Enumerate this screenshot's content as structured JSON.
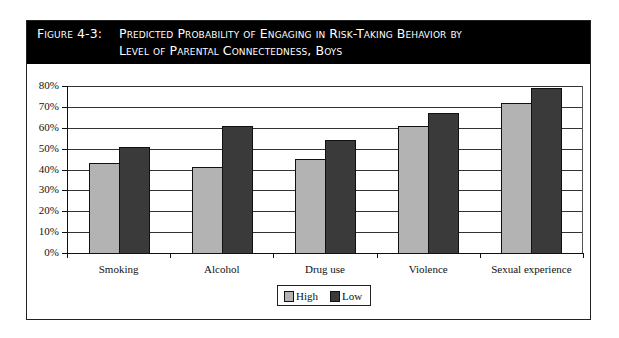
{
  "figure": {
    "label": "Figure 4-3:",
    "title_line1": "Predicted Probability of Engaging in Risk-Taking Behavior by",
    "title_line2": "Level of Parental Connectedness, Boys"
  },
  "colors": {
    "high": "#b3b3b3",
    "low": "#3a3a3a",
    "titlebar": "#000000"
  },
  "chart_data": {
    "type": "bar",
    "title": "Figure 4-3: Predicted Probability of Engaging in Risk-Taking Behavior by Level of Parental Connectedness, Boys",
    "categories": [
      "Smoking",
      "Alcohol",
      "Drug use",
      "Violence",
      "Sexual experience"
    ],
    "series": [
      {
        "name": "High",
        "values": [
          43,
          41,
          45,
          61,
          72
        ]
      },
      {
        "name": "Low",
        "values": [
          51,
          61,
          54,
          67,
          79
        ]
      }
    ],
    "xlabel": "",
    "ylabel": "",
    "ylim": [
      0,
      80
    ],
    "yticks": [
      "0%",
      "10%",
      "20%",
      "30%",
      "40%",
      "50%",
      "60%",
      "70%",
      "80%"
    ],
    "grid": true,
    "legend_position": "bottom"
  },
  "legend": {
    "high": "High",
    "low": "Low"
  }
}
